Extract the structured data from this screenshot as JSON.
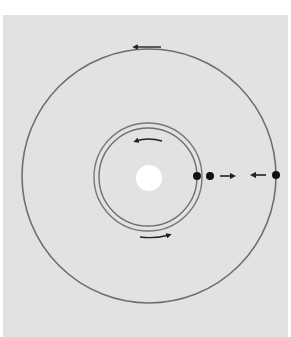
{
  "diagram": {
    "type": "orbital-diagram",
    "colors": {
      "background": "#e2e2e2",
      "orbit": "#6e6e6e",
      "sun": "#ffffff",
      "body": "#111111",
      "arrow": "#333333"
    },
    "center": {
      "x": 149,
      "y": 176
    },
    "sun": {
      "label": "central-star",
      "radius": 13
    },
    "orbits": [
      {
        "name": "inner-orbit-a",
        "radius": 49,
        "direction": "counterclockwise"
      },
      {
        "name": "inner-orbit-b",
        "radius": 54,
        "direction": "counterclockwise"
      },
      {
        "name": "outer-orbit",
        "radius": 127,
        "direction": "counterclockwise"
      }
    ],
    "bodies": [
      {
        "name": "body-inner-a",
        "orbit": "inner-orbit-a",
        "angle_deg": 0
      },
      {
        "name": "body-inner-b",
        "orbit": "inner-orbit-b",
        "angle_deg": 0
      },
      {
        "name": "body-outer",
        "orbit": "outer-orbit",
        "angle_deg": 0
      }
    ],
    "motion_arrows": [
      {
        "name": "outer-orbit-arrow",
        "direction": "left",
        "position": "top of outer orbit"
      },
      {
        "name": "inner-orbit-top-arrow",
        "direction": "left",
        "position": "inside top of inner orbit"
      },
      {
        "name": "inner-orbit-bottom-arrow",
        "direction": "right",
        "position": "below inner orbit"
      },
      {
        "name": "outward-arrow",
        "direction": "right",
        "position": "between inner and outer bodies"
      },
      {
        "name": "inward-arrow",
        "direction": "left",
        "position": "between inner and outer bodies"
      }
    ]
  }
}
